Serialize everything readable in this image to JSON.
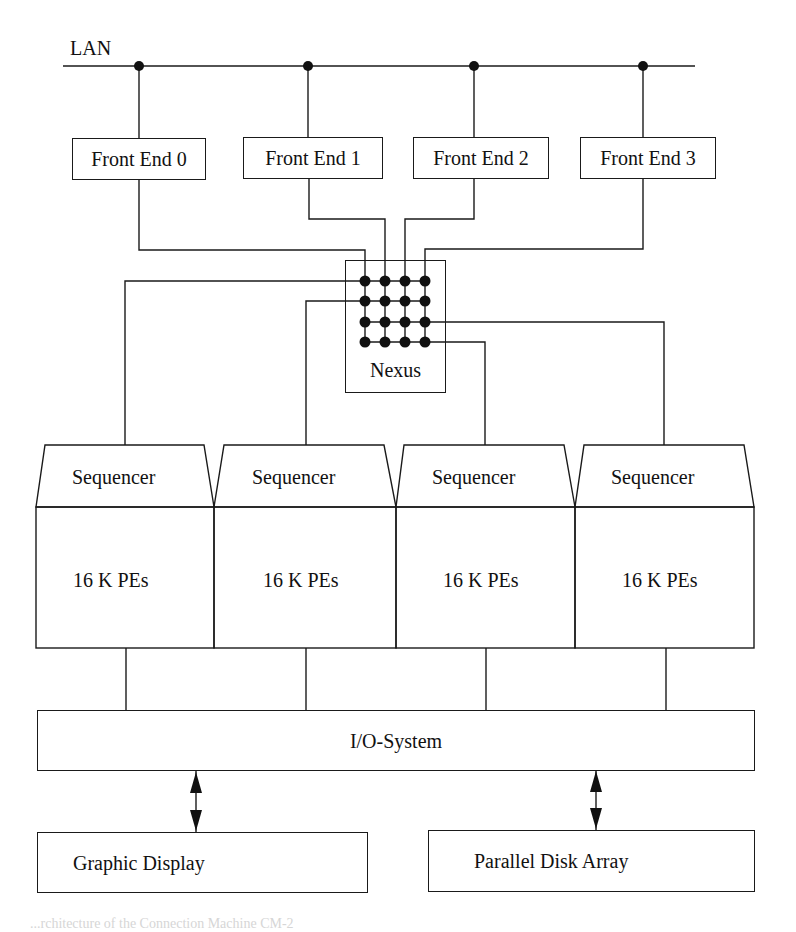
{
  "diagram": {
    "network": {
      "label": "LAN"
    },
    "front_ends": [
      {
        "label": "Front End 0"
      },
      {
        "label": "Front End 1"
      },
      {
        "label": "Front End 2"
      },
      {
        "label": "Front End 3"
      }
    ],
    "switch": {
      "label": "Nexus",
      "grid_rows": 4,
      "grid_cols": 4
    },
    "units": [
      {
        "sequencer_label": "Sequencer",
        "pe_label": "16 K PEs"
      },
      {
        "sequencer_label": "Sequencer",
        "pe_label": "16 K PEs"
      },
      {
        "sequencer_label": "Sequencer",
        "pe_label": "16 K PEs"
      },
      {
        "sequencer_label": "Sequencer",
        "pe_label": "16 K PEs"
      }
    ],
    "io_system": {
      "label": "I/O-System"
    },
    "peripherals": [
      {
        "label": "Graphic Display"
      },
      {
        "label": "Parallel Disk Array"
      }
    ],
    "caption": "...rchitecture of the Connection Machine CM-2",
    "colors": {
      "line": "#1a1a1a",
      "background": "#ffffff"
    }
  }
}
